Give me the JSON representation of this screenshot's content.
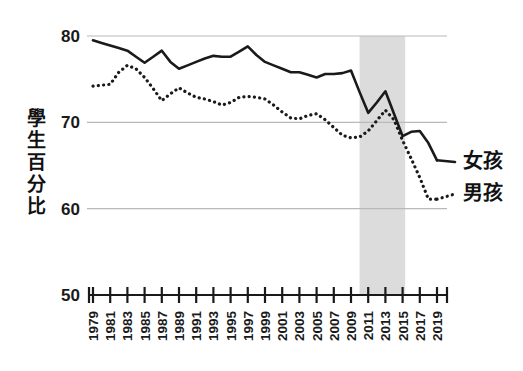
{
  "chart_data": {
    "type": "line",
    "title": "",
    "xlabel": "",
    "ylabel": "學生百分比",
    "ylim": [
      50,
      80
    ],
    "ytick_labels": [
      "80",
      "70",
      "60",
      "50"
    ],
    "yticks": [
      80,
      70,
      60,
      50
    ],
    "grid": "horizontal-gridlines-at-60-70-80",
    "legend_position": "right-inline",
    "xlim": [
      1979,
      2019
    ],
    "xtick_labels": [
      "1979",
      "1981",
      "1983",
      "1985",
      "1987",
      "1989",
      "1991",
      "1993",
      "1995",
      "1997",
      "1999",
      "2001",
      "2003",
      "2005",
      "2007",
      "2009",
      "2011",
      "2013",
      "2015",
      "2017",
      "2019"
    ],
    "x": [
      1979,
      1980,
      1981,
      1982,
      1983,
      1984,
      1985,
      1986,
      1987,
      1988,
      1989,
      1990,
      1991,
      1992,
      1993,
      1994,
      1995,
      1996,
      1997,
      1998,
      1999,
      2000,
      2001,
      2002,
      2003,
      2004,
      2005,
      2006,
      2007,
      2008,
      2009,
      2010,
      2011,
      2012,
      2013,
      2014,
      2015,
      2016,
      2017,
      2018,
      2019
    ],
    "series": [
      {
        "name": "女孩",
        "style": "solid",
        "color": "#1a1a1a",
        "values": [
          79.5,
          79.2,
          78.9,
          78.6,
          78.3,
          77.6,
          76.9,
          77.6,
          78.3,
          77.0,
          76.2,
          76.6,
          77.0,
          77.4,
          77.7,
          77.6,
          77.6,
          78.2,
          78.8,
          77.8,
          77.0,
          76.6,
          76.2,
          75.8,
          75.8,
          75.5,
          75.2,
          75.6,
          75.6,
          75.7,
          76.0,
          73.5,
          71.1,
          72.3,
          73.6,
          71.0,
          68.4,
          68.9,
          69.0,
          67.6,
          65.6
        ]
      },
      {
        "name": "男孩",
        "style": "dotted",
        "color": "#1a1a1a",
        "values": [
          74.2,
          74.3,
          74.4,
          75.8,
          76.6,
          76.2,
          75.2,
          73.9,
          72.5,
          73.3,
          74.0,
          73.4,
          72.9,
          72.7,
          72.4,
          72.0,
          72.3,
          72.9,
          73.0,
          72.9,
          72.7,
          72.0,
          71.2,
          70.5,
          70.4,
          70.8,
          71.0,
          70.3,
          69.4,
          68.5,
          68.2,
          68.3,
          69.0,
          70.2,
          71.4,
          70.3,
          67.9,
          65.8,
          63.6,
          61.1,
          61.1
        ]
      }
    ],
    "shaded_band": {
      "label": "",
      "x_start": 2010,
      "x_end": 2015.3,
      "color": "#dcdcdc"
    }
  }
}
